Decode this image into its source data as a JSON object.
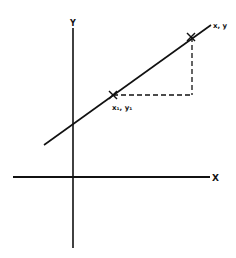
{
  "diagram": {
    "type": "line-slope",
    "axes": {
      "x_label": "X",
      "y_label": "Y"
    },
    "points": [
      {
        "id": "p1",
        "label": "x₁, y₁",
        "x": 113,
        "y": 95
      },
      {
        "id": "p2",
        "label": "x, y",
        "x": 191,
        "y": 37
      }
    ],
    "line": {
      "x1": 44,
      "y1": 145,
      "x2": 211,
      "y2": 25
    },
    "colors": {
      "ink": "#111111",
      "background": "#ffffff"
    }
  }
}
